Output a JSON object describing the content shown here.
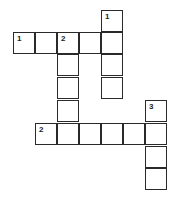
{
  "puzzle": {
    "type": "crossword",
    "cell_size": 22,
    "origin": {
      "x": 13,
      "y": 10
    },
    "cells": [
      {
        "col": 4,
        "row": 0,
        "number": "1"
      },
      {
        "col": 4,
        "row": 1,
        "number": ""
      },
      {
        "col": 4,
        "row": 2,
        "number": ""
      },
      {
        "col": 4,
        "row": 3,
        "number": ""
      },
      {
        "col": 0,
        "row": 1,
        "number": "1"
      },
      {
        "col": 1,
        "row": 1,
        "number": ""
      },
      {
        "col": 2,
        "row": 1,
        "number": "2"
      },
      {
        "col": 3,
        "row": 1,
        "number": ""
      },
      {
        "col": 2,
        "row": 2,
        "number": ""
      },
      {
        "col": 2,
        "row": 3,
        "number": ""
      },
      {
        "col": 2,
        "row": 4,
        "number": ""
      },
      {
        "col": 2,
        "row": 5,
        "number": ""
      },
      {
        "col": 6,
        "row": 4,
        "number": "3"
      },
      {
        "col": 1,
        "row": 5,
        "number": "2"
      },
      {
        "col": 3,
        "row": 5,
        "number": ""
      },
      {
        "col": 4,
        "row": 5,
        "number": ""
      },
      {
        "col": 5,
        "row": 5,
        "number": ""
      },
      {
        "col": 6,
        "row": 5,
        "number": ""
      },
      {
        "col": 6,
        "row": 6,
        "number": ""
      },
      {
        "col": 6,
        "row": 7,
        "number": ""
      }
    ],
    "entries": [
      {
        "id": "1-across",
        "number": "1",
        "direction": "across",
        "length": 5
      },
      {
        "id": "2-across",
        "number": "2",
        "direction": "across",
        "length": 6
      },
      {
        "id": "1-down",
        "number": "1",
        "direction": "down",
        "length": 4
      },
      {
        "id": "2-down",
        "number": "2",
        "direction": "down",
        "length": 5
      },
      {
        "id": "3-down",
        "number": "3",
        "direction": "down",
        "length": 4
      }
    ]
  }
}
